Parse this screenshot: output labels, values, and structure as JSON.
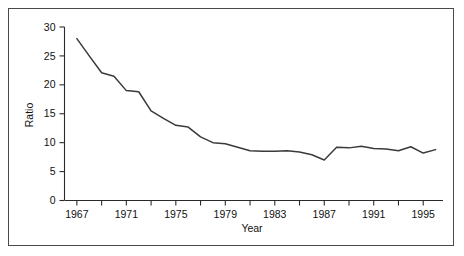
{
  "figure": {
    "border_color": "#4a4a4a",
    "background_color": "#ffffff"
  },
  "chart_data": {
    "type": "line",
    "title": "",
    "xlabel": "Year",
    "ylabel": "Ratio",
    "xlim": [
      1966,
      1996.6
    ],
    "ylim": [
      0,
      30
    ],
    "grid": false,
    "legend": null,
    "line_color": "#3a3a3a",
    "x_tick_labels": [
      "1967",
      "1971",
      "1975",
      "1979",
      "1983",
      "1987",
      "1991",
      "1995"
    ],
    "x_tick_values": [
      1967,
      1971,
      1975,
      1979,
      1983,
      1987,
      1991,
      1995
    ],
    "x_minor_tick_values": [
      1969,
      1973,
      1977,
      1981,
      1985,
      1989,
      1993
    ],
    "y_tick_labels": [
      "0",
      "5",
      "10",
      "15",
      "20",
      "25",
      "30"
    ],
    "y_tick_values": [
      0,
      5,
      10,
      15,
      20,
      25,
      30
    ],
    "x": [
      1967,
      1968,
      1969,
      1970,
      1971,
      1972,
      1973,
      1974,
      1975,
      1976,
      1977,
      1978,
      1979,
      1980,
      1981,
      1982,
      1983,
      1984,
      1985,
      1986,
      1987,
      1988,
      1989,
      1990,
      1991,
      1992,
      1993,
      1994,
      1995,
      1996
    ],
    "values": [
      28.0,
      25.0,
      22.1,
      21.5,
      19.0,
      18.8,
      15.5,
      14.2,
      13.0,
      12.7,
      11.0,
      10.0,
      9.8,
      9.2,
      8.6,
      8.5,
      8.5,
      8.6,
      8.4,
      7.9,
      7.0,
      9.2,
      9.1,
      9.4,
      9.0,
      8.9,
      8.6,
      9.3,
      8.2,
      8.8
    ]
  }
}
